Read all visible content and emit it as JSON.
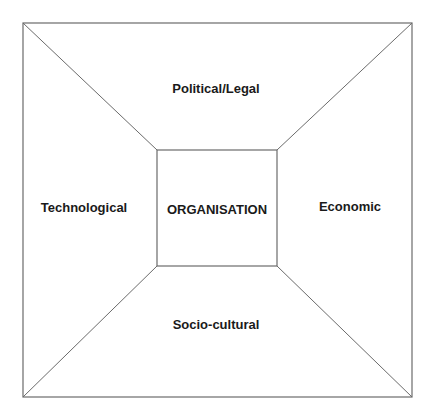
{
  "diagram": {
    "type": "environment-framework",
    "center": {
      "label": "ORGANISATION"
    },
    "segments": {
      "top": "Political/Legal",
      "left": "Technological",
      "right": "Economic",
      "bottom": "Socio-cultural"
    },
    "colors": {
      "line": "#6b6b6b",
      "text": "#1a1a1a",
      "background": "#ffffff"
    }
  }
}
